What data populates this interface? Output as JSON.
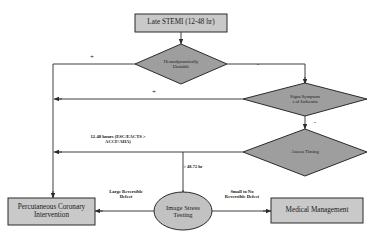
{
  "diagram": {
    "colors": {
      "box_fill": "#c9c9c9",
      "diamond_fill": "#9e9e9e",
      "ellipse_fill": "#c2c2c2",
      "stroke": "#2b2b2b",
      "background": "#ffffff"
    },
    "nodes": {
      "late_stemi": {
        "label": "Late STEMI (12-48 hr)",
        "shape": "box"
      },
      "hemodynamically_unstable": {
        "label": "Hemodynamically\nUnstable",
        "shape": "diamond"
      },
      "signs_symptoms_ischemia": {
        "label": "Signs/Symptom\ns of Ischemia",
        "shape": "diamond"
      },
      "assess_timing": {
        "label": "Assess Timing",
        "shape": "diamond"
      },
      "pci": {
        "label": "Percutaneous Coronary\nIntervention",
        "shape": "box"
      },
      "image_stress_testing": {
        "label": "Image Stress\nTesting",
        "shape": "ellipse"
      },
      "medical_management": {
        "label": "Medical Management",
        "shape": "box"
      }
    },
    "edge_labels": {
      "unstable_positive": "+",
      "unstable_negative": "-",
      "ischemia_positive": "+",
      "ischemia_negative": "-",
      "timing_early": "12-48 hours (ESC/EACTS >\nACCF/AHA)",
      "timing_late": "> 48-72 hr",
      "large_reversible_defect": "Large Reversible\nDefect",
      "small_no_reversible_defect": "Small to No\nReversible Defect"
    }
  }
}
